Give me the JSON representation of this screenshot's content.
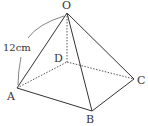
{
  "diagram": {
    "type": "square-pyramid",
    "colors": {
      "line": "#333333",
      "hidden": "#555555",
      "background": "#ffffff"
    },
    "vertices": {
      "O": {
        "label": "O",
        "x": 67,
        "y": 13
      },
      "A": {
        "label": "A",
        "x": 17,
        "y": 88
      },
      "B": {
        "label": "B",
        "x": 92,
        "y": 111
      },
      "C": {
        "label": "C",
        "x": 134,
        "y": 79
      },
      "D": {
        "label": "D",
        "x": 67,
        "y": 62
      }
    },
    "edges": [
      {
        "from": "O",
        "to": "A",
        "style": "solid"
      },
      {
        "from": "O",
        "to": "B",
        "style": "solid"
      },
      {
        "from": "O",
        "to": "C",
        "style": "solid"
      },
      {
        "from": "A",
        "to": "B",
        "style": "solid"
      },
      {
        "from": "B",
        "to": "C",
        "style": "solid"
      },
      {
        "from": "O",
        "to": "D",
        "style": "dashed"
      },
      {
        "from": "A",
        "to": "D",
        "style": "dashed"
      },
      {
        "from": "D",
        "to": "C",
        "style": "dashed"
      }
    ],
    "measurement": {
      "label": "12cm",
      "edge": "OA"
    }
  }
}
